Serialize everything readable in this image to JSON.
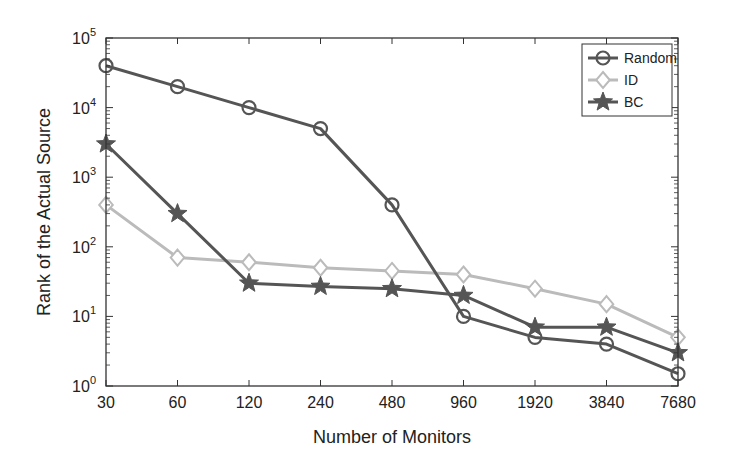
{
  "chart_data": {
    "type": "line",
    "title": "",
    "xlabel": "Number of Monitors",
    "ylabel": "Rank of the Actual Source",
    "yscale": "log",
    "ylim": [
      1,
      100000
    ],
    "y_tick_labels": [
      "10^0",
      "10^1",
      "10^2",
      "10^3",
      "10^4",
      "10^5"
    ],
    "categories": [
      "30",
      "60",
      "120",
      "240",
      "480",
      "960",
      "1920",
      "3840",
      "7680"
    ],
    "grid": false,
    "legend_position": "upper right",
    "series": [
      {
        "name": "Random",
        "marker": "circle",
        "color": "#555555",
        "values": [
          40000,
          20000,
          10000,
          5000,
          400,
          10,
          5,
          4,
          1.5
        ]
      },
      {
        "name": "ID",
        "marker": "diamond",
        "color": "#bbbbbb",
        "values": [
          400,
          70,
          60,
          50,
          45,
          40,
          25,
          15,
          5
        ]
      },
      {
        "name": "BC",
        "marker": "star",
        "color": "#555555",
        "values": [
          3000,
          300,
          30,
          27,
          25,
          20,
          7,
          7,
          3
        ]
      }
    ]
  }
}
